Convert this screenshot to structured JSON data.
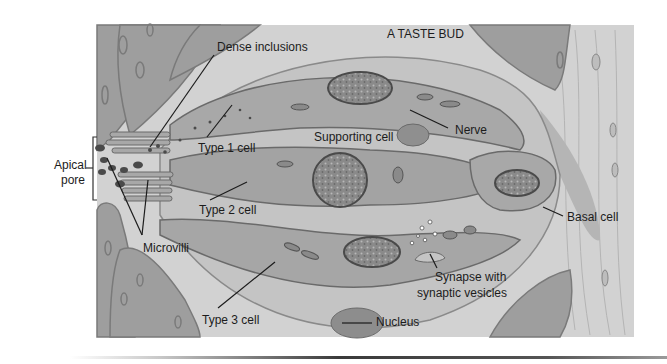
{
  "title": "A TASTE BUD",
  "labels": {
    "dense_inclusions": "Dense inclusions",
    "type1": "Type 1 cell",
    "supporting": "Supporting cell",
    "nerve": "Nerve",
    "apical_line1": "Apical",
    "apical_line2": "pore",
    "type2": "Type 2 cell",
    "microvilli": "Microvilli",
    "basal": "Basal cell",
    "synapse_line1": "Synapse with",
    "synapse_line2": "synaptic vesicles",
    "type3": "Type 3 cell",
    "nucleus": "Nucleus"
  },
  "colors": {
    "background": "#ffffff",
    "tissue": "#cfcfcf",
    "epithelium": "#9e9e9e",
    "cell_body": "#a9a9a9",
    "nucleus": "#7a7a7a",
    "outline": "#5a5a5a",
    "text": "#1c1c1c"
  }
}
